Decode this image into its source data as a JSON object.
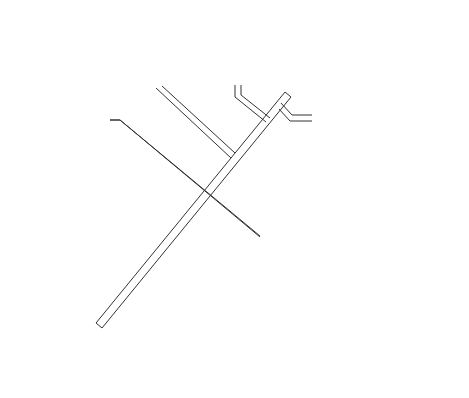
{
  "diagram": {
    "type": "bus network topology",
    "nodes": {
      "large_host": {
        "line1": "Large",
        "line2": "host"
      },
      "small_host": {
        "line1": "Small",
        "line2": "host"
      },
      "gateway": {
        "line1": "Internetwork",
        "line2": "gateway"
      },
      "satellite": {
        "line1": "Dedicated",
        "line2": "or shared",
        "line3": "satellite",
        "line4": "service"
      },
      "public_networks": {
        "line1": "To public",
        "line2": "networks"
      },
      "bus": {
        "line1": "Communications",
        "line2": "bus"
      },
      "shared_device": {
        "line1": "Shared device",
        "line2": "(e.g., printer,",
        "line3": "disk unit, etc.)"
      }
    },
    "icons": {
      "terminals": 2,
      "telephones": 5,
      "small_device_circle": 1,
      "satellite_dish": 1,
      "lightning_link": 1
    },
    "colors": {
      "line": "#333333",
      "background": "#ffffff"
    }
  }
}
